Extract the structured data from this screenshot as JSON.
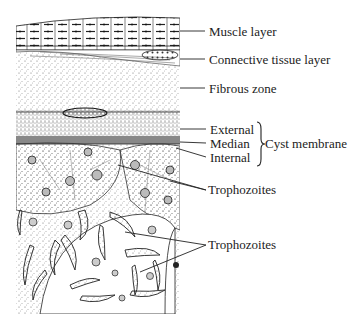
{
  "diagram": {
    "ink_color": "#222222",
    "labels": {
      "muscle_layer": "Muscle layer",
      "connective_tissue_layer": "Connective tissue layer",
      "fibrous_zone": "Fibrous zone",
      "external": "External",
      "median": "Median",
      "internal": "Internal",
      "cyst_membrane": "Cyst membrane",
      "trophozoites_1": "Trophozoites",
      "trophozoites_2": "Trophozoites"
    }
  }
}
